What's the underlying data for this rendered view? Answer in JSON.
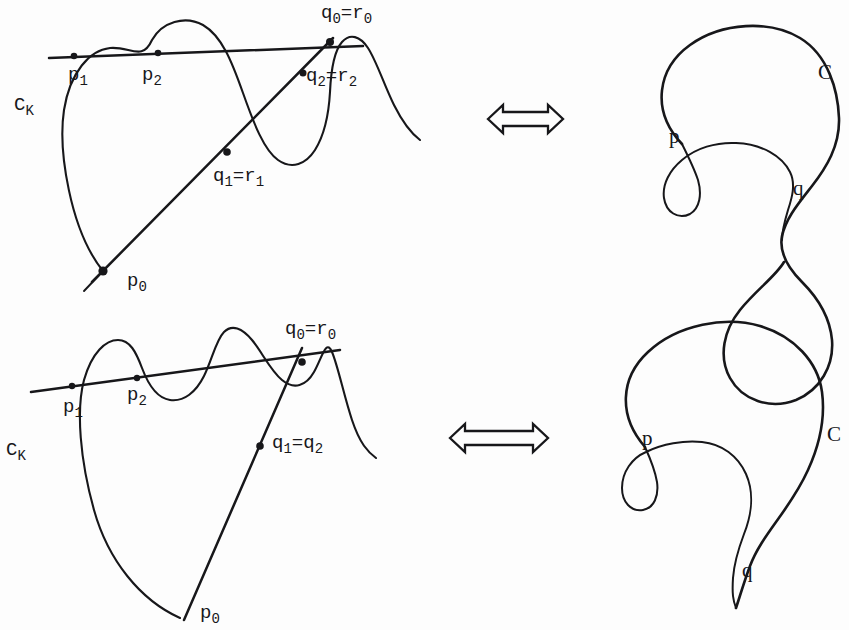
{
  "figure": {
    "domain": "mathematical-diagram",
    "background_color": "#fdfdfd",
    "ink_color": "#17171a",
    "width": 849,
    "height": 630
  },
  "rows": [
    {
      "id": "row-top",
      "left_diagram": {
        "curve_label": "C",
        "curve_label_sub": "K",
        "points": [
          {
            "id": "p0",
            "base": "p",
            "sub": "0",
            "text": "p",
            "subtext": "0"
          },
          {
            "id": "p1",
            "base": "p",
            "sub": "1",
            "text": "p",
            "subtext": "1"
          },
          {
            "id": "p2",
            "base": "p",
            "sub": "2",
            "text": "p",
            "subtext": "2"
          },
          {
            "id": "q0r0",
            "lhs": "q",
            "lhs_sub": "0",
            "eq": "=",
            "rhs": "r",
            "rhs_sub": "0"
          },
          {
            "id": "q1r1",
            "lhs": "q",
            "lhs_sub": "1",
            "eq": "=",
            "rhs": "r",
            "rhs_sub": "1"
          },
          {
            "id": "q2r2",
            "lhs": "q",
            "lhs_sub": "2",
            "eq": "=",
            "rhs": "r",
            "rhs_sub": "2"
          }
        ]
      },
      "arrow": {
        "glyph": "double-headed-arrow",
        "direction": "both"
      },
      "right_diagram": {
        "curve_label": "C",
        "points": [
          {
            "id": "p",
            "text": "p"
          },
          {
            "id": "q",
            "text": "q"
          }
        ],
        "crossings": 2,
        "closed": true
      }
    },
    {
      "id": "row-bottom",
      "left_diagram": {
        "curve_label": "C",
        "curve_label_sub": "K",
        "points": [
          {
            "id": "p0",
            "base": "p",
            "sub": "0",
            "text": "p",
            "subtext": "0"
          },
          {
            "id": "p1",
            "base": "p",
            "sub": "1",
            "text": "p",
            "subtext": "1"
          },
          {
            "id": "p2",
            "base": "p",
            "sub": "2",
            "text": "p",
            "subtext": "2"
          },
          {
            "id": "q0r0",
            "lhs": "q",
            "lhs_sub": "0",
            "eq": "=",
            "rhs": "r",
            "rhs_sub": "0"
          },
          {
            "id": "q1q2",
            "lhs": "q",
            "lhs_sub": "1",
            "eq": "=",
            "rhs": "q",
            "rhs_sub": "2"
          }
        ]
      },
      "arrow": {
        "glyph": "double-headed-arrow",
        "direction": "both"
      },
      "right_diagram": {
        "curve_label": "C",
        "points": [
          {
            "id": "p",
            "text": "p"
          },
          {
            "id": "q",
            "text": "q"
          }
        ],
        "crossings": 1,
        "closed": false
      }
    }
  ],
  "labels": {
    "top_left": {
      "ck": {
        "base": "C",
        "sub": "K"
      },
      "p0": {
        "base": "p",
        "sub": "0"
      },
      "p1": {
        "base": "p",
        "sub": "1"
      },
      "p2": {
        "base": "p",
        "sub": "2"
      },
      "q0r0": {
        "lhs": "q",
        "lhs_sub": "0",
        "eq": "=",
        "rhs": "r",
        "rhs_sub": "0"
      },
      "q1r1": {
        "lhs": "q",
        "lhs_sub": "1",
        "eq": "=",
        "rhs": "r",
        "rhs_sub": "1"
      },
      "q2r2": {
        "lhs": "q",
        "lhs_sub": "2",
        "eq": "=",
        "rhs": "r",
        "rhs_sub": "2"
      }
    },
    "top_right": {
      "c": "C",
      "p": "p",
      "q": "q"
    },
    "bottom_left": {
      "ck": {
        "base": "C",
        "sub": "K"
      },
      "p0": {
        "base": "p",
        "sub": "0"
      },
      "p1": {
        "base": "p",
        "sub": "1"
      },
      "p2": {
        "base": "p",
        "sub": "2"
      },
      "q0r0": {
        "lhs": "q",
        "lhs_sub": "0",
        "eq": "=",
        "rhs": "r",
        "rhs_sub": "0"
      },
      "q1q2": {
        "lhs": "q",
        "lhs_sub": "1",
        "eq": "=",
        "rhs": "q",
        "rhs_sub": "2"
      }
    },
    "bottom_right": {
      "c": "C",
      "p": "p",
      "q": "q"
    }
  }
}
